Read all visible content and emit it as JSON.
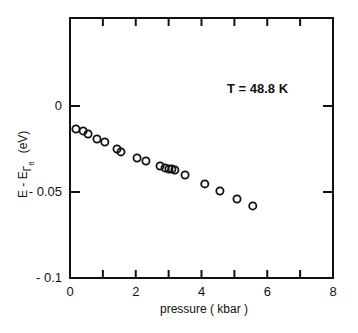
{
  "chart_data": {
    "type": "scatter",
    "title": "",
    "annotation": "T = 48.8  K",
    "xlabel": "pressure  ( kbar )",
    "ylabel_main": "E - E",
    "ylabel_sub": "Γ",
    "ylabel_subsub": "6",
    "ylabel_unit": "(eV)",
    "xlim": [
      0,
      8
    ],
    "ylim": [
      -0.1,
      0.04
    ],
    "xticks": [
      0,
      2,
      4,
      6,
      8
    ],
    "xtick_labels": [
      "0",
      "2",
      "4",
      "6",
      "8"
    ],
    "xminor_ticks": [
      1,
      3,
      5,
      7
    ],
    "yticks": [
      0,
      -0.05,
      -0.1
    ],
    "ytick_labels": [
      "0",
      "- 0.05",
      "- 0.1"
    ],
    "grid": false,
    "legend": null,
    "marker": "open-circle",
    "series": [
      {
        "name": "T = 48.8 K",
        "x": [
          0.18,
          0.4,
          0.55,
          0.82,
          1.06,
          1.43,
          1.55,
          2.04,
          2.31,
          2.74,
          2.89,
          3.01,
          3.1,
          3.19,
          3.5,
          4.1,
          4.56,
          5.08,
          5.56
        ],
        "y": [
          -0.0134,
          -0.0145,
          -0.0163,
          -0.0192,
          -0.0209,
          -0.025,
          -0.0267,
          -0.0302,
          -0.032,
          -0.0349,
          -0.036,
          -0.0366,
          -0.0366,
          -0.0372,
          -0.0401,
          -0.0453,
          -0.0494,
          -0.0541,
          -0.0581
        ]
      }
    ]
  }
}
